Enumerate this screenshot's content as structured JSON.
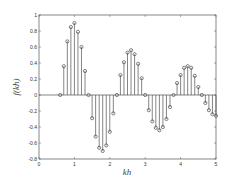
{
  "chart_data": {
    "type": "stem",
    "title": "",
    "xlabel": "kh",
    "ylabel": "f(kh)",
    "xlim": [
      0,
      5
    ],
    "ylim": [
      -0.8,
      1
    ],
    "xticks": [
      0,
      1,
      2,
      3,
      4,
      5
    ],
    "xtick_labels": [
      "0",
      "1",
      "2",
      "3",
      "4",
      "5"
    ],
    "yticks": [
      1,
      0.8,
      0.6,
      0.4,
      0.2,
      0,
      -0.2,
      -0.4,
      -0.6,
      -0.8
    ],
    "ytick_labels": [
      "1",
      "0.8",
      "0.6",
      "0.4",
      "0.2",
      "0",
      "-0.2",
      "-0.4",
      "-0.6",
      "-0.8"
    ],
    "grid": false,
    "baseline": 0,
    "marker": "circle",
    "color": "#333333",
    "x": [
      0.6,
      0.7,
      0.8,
      0.9,
      1.0,
      1.1,
      1.2,
      1.3,
      1.4,
      1.5,
      1.6,
      1.7,
      1.8,
      1.9,
      2.0,
      2.1,
      2.2,
      2.3,
      2.4,
      2.5,
      2.6,
      2.7,
      2.8,
      2.9,
      3.0,
      3.1,
      3.2,
      3.3,
      3.4,
      3.5,
      3.6,
      3.7,
      3.8,
      3.9,
      4.0,
      4.1,
      4.2,
      4.3,
      4.4,
      4.5,
      4.6,
      4.7,
      4.8,
      4.9,
      5.0
    ],
    "y": [
      0,
      0.36,
      0.67,
      0.85,
      0.9,
      0.79,
      0.6,
      0.3,
      0,
      -0.29,
      -0.52,
      -0.66,
      -0.7,
      -0.63,
      -0.46,
      -0.23,
      0,
      0.25,
      0.41,
      0.53,
      0.56,
      0.51,
      0.39,
      0.21,
      0,
      -0.19,
      -0.33,
      -0.41,
      -0.44,
      -0.4,
      -0.3,
      -0.15,
      0,
      0.15,
      0.25,
      0.34,
      0.36,
      0.34,
      0.24,
      0.1,
      0,
      -0.1,
      -0.19,
      -0.24,
      -0.26
    ]
  }
}
